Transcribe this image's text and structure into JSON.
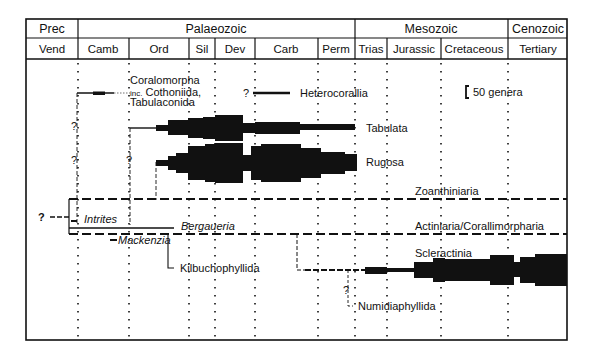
{
  "header": {
    "eras": [
      {
        "label": "Prec",
        "x0": 26,
        "x1": 78
      },
      {
        "label": "Palaeozoic",
        "x0": 78,
        "x1": 355
      },
      {
        "label": "Mesozoic",
        "x0": 355,
        "x1": 508
      },
      {
        "label": "Cenozoic",
        "x0": 508,
        "x1": 567
      }
    ],
    "periods": [
      {
        "label": "Vend",
        "x0": 26,
        "x1": 78
      },
      {
        "label": "Camb",
        "x0": 78,
        "x1": 129
      },
      {
        "label": "Ord",
        "x0": 129,
        "x1": 189
      },
      {
        "label": "Sil",
        "x0": 189,
        "x1": 215
      },
      {
        "label": "Dev",
        "x0": 215,
        "x1": 255
      },
      {
        "label": "Carb",
        "x0": 255,
        "x1": 318
      },
      {
        "label": "Perm",
        "x0": 318,
        "x1": 355
      },
      {
        "label": "Trias",
        "x0": 355,
        "x1": 387
      },
      {
        "label": "Jurassic",
        "x0": 387,
        "x1": 441
      },
      {
        "label": "Cretaceous",
        "x0": 441,
        "x1": 508
      },
      {
        "label": "Tertiary",
        "x0": 508,
        "x1": 567
      }
    ]
  },
  "scale_bar": {
    "label": "50 genera"
  },
  "taxa": {
    "coralomorpha": {
      "line1": "Coralomorpha",
      "prefix": "inc.",
      "line2": "Cothoniida,",
      "line3": "Tabulaconida"
    },
    "heterocorallia": "Heterocorallia",
    "tabulata": "Tabulata",
    "rugosa": "Rugosa",
    "zoantharia": "Zoanthiniaria",
    "intrites": "Intrites",
    "bergaueria": "Bergaueria",
    "actiniaria": "Actiniaria/Corallimorpharia",
    "mackenzia": "Mackenzia",
    "kilbuchophyllida": "Kilbuchophyllida",
    "scleractinia": "Scleractinia",
    "numidiaphyllida": "Numidiaphyllida"
  },
  "uncertainty_mark": "?",
  "colors": {
    "ink": "#111111",
    "background": "#ffffff"
  }
}
